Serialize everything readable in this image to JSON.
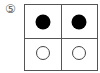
{
  "figure": {
    "label": "⑤",
    "grid": {
      "rows": 2,
      "cols": 2
    },
    "cells": [
      {
        "row": 0,
        "col": 0,
        "marker": "filled-circle"
      },
      {
        "row": 0,
        "col": 1,
        "marker": "filled-circle"
      },
      {
        "row": 1,
        "col": 0,
        "marker": "open-circle"
      },
      {
        "row": 1,
        "col": 1,
        "marker": "open-circle"
      }
    ],
    "colors": {
      "line": "#555555",
      "filled": "#000000",
      "open_stroke": "#444444",
      "background": "#ffffff"
    }
  }
}
